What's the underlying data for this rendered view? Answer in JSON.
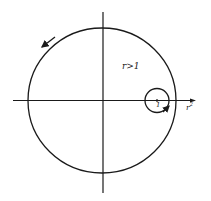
{
  "diagram": {
    "type": "complex-plane contour",
    "colors": {
      "stroke": "#1a1a1a",
      "background": "#ffffff"
    },
    "axes": {
      "horizontal": {
        "x1": 13,
        "x2": 196,
        "y": 100.5
      },
      "vertical": {
        "x": 103,
        "y1": 12,
        "y2": 193
      }
    },
    "large_circle": {
      "cx": 102,
      "cy": 100.5,
      "rx": 74,
      "ry": 72.5,
      "orientation": "counterclockwise"
    },
    "small_circle": {
      "cx": 157,
      "cy": 100.5,
      "r": 12,
      "orientation": "clockwise"
    },
    "labels": {
      "region": "r>1",
      "center_point": "1",
      "axis_label_base": "r",
      "axis_label_exp": "2"
    }
  }
}
